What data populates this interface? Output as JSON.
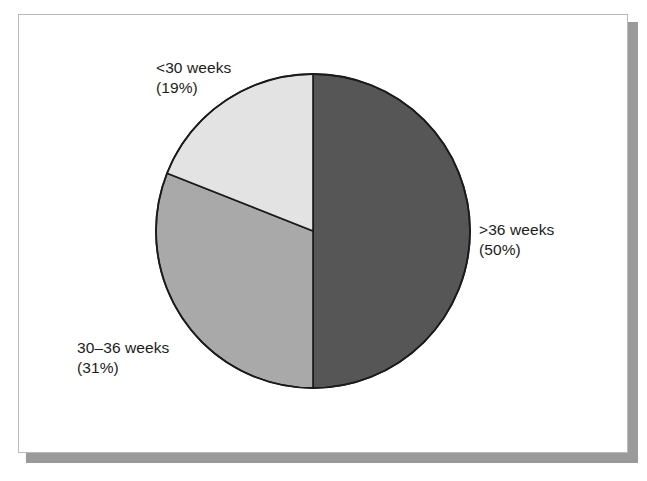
{
  "figure": {
    "background_color": "#ffffff",
    "frame_border_color": "#b9b9b9",
    "shadow_color": "#9a9a9a",
    "outline_color": "#1a1a1a",
    "label_text_color": "#1c1c1c"
  },
  "chart_data": {
    "type": "pie",
    "title": "",
    "subtitle": "",
    "xlabel": "",
    "ylabel": "",
    "grid": false,
    "legend_position": "none",
    "label_style": "outside-callout-free",
    "start_angle_deg": 0,
    "direction": "clockwise",
    "categories": [
      ">36 weeks",
      "30–36 weeks",
      "<30 weeks"
    ],
    "values": [
      50,
      31,
      19
    ],
    "value_unit": "%",
    "colors": [
      "#565656",
      "#a9a9a9",
      "#e3e3e3"
    ],
    "slices": [
      {
        "name": "gt36",
        "category": ">36 weeks",
        "value": 50,
        "percent_text": "(50%)",
        "color": "#565656",
        "start_deg": 0,
        "end_deg": 180
      },
      {
        "name": "range30to36",
        "category": "30–36 weeks",
        "value": 31,
        "percent_text": "(31%)",
        "color": "#a9a9a9",
        "start_deg": 180,
        "end_deg": 291.6
      },
      {
        "name": "lt30",
        "category": "<30 weeks",
        "value": 19,
        "percent_text": "(19%)",
        "color": "#e3e3e3",
        "start_deg": 291.6,
        "end_deg": 360
      }
    ]
  },
  "labels": {
    "lt30": {
      "line1": "<30 weeks",
      "line2": "(19%)"
    },
    "gt36": {
      "line1": ">36 weeks",
      "line2": "(50%)"
    },
    "range30to36": {
      "line1": "30–36 weeks",
      "line2": "(31%)"
    }
  }
}
